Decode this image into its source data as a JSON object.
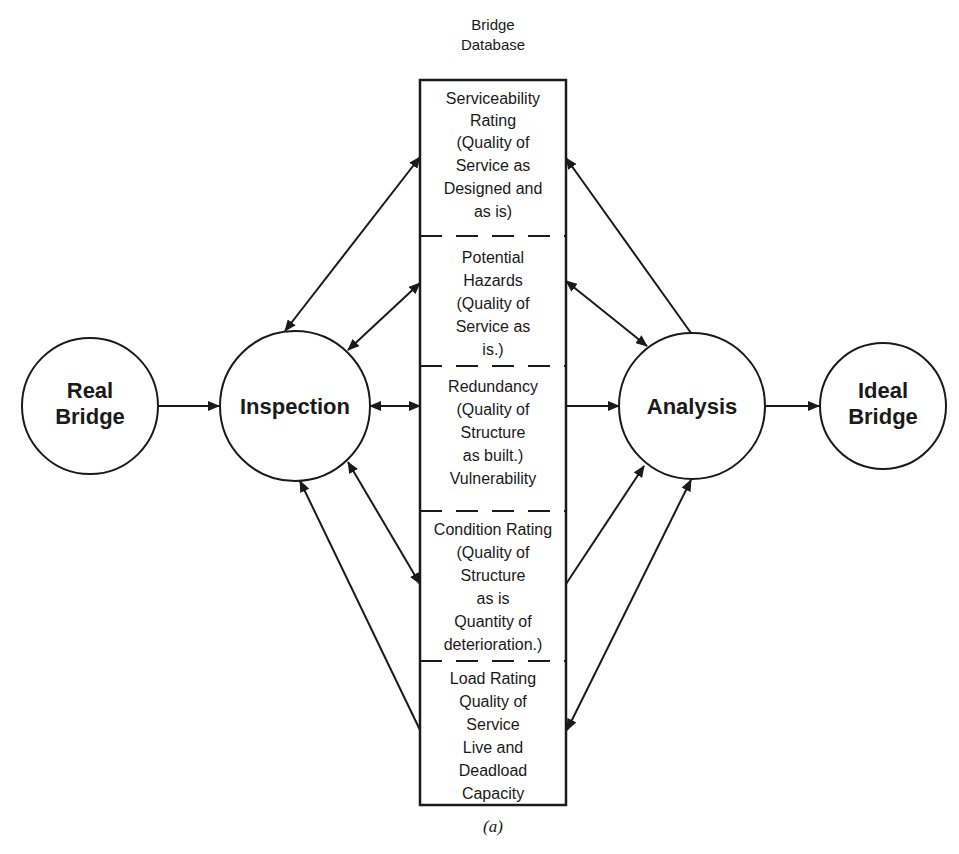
{
  "diagram": {
    "database_header": [
      "Bridge",
      "Database"
    ],
    "nodes": {
      "real_bridge": [
        "Real",
        "Bridge"
      ],
      "inspection": [
        "Inspection"
      ],
      "analysis": [
        "Analysis"
      ],
      "ideal_bridge": [
        "Ideal",
        "Bridge"
      ]
    },
    "sections": [
      {
        "id": "serviceability-rating",
        "lines": [
          "Serviceability",
          "Rating",
          "(Quality of",
          "Service as",
          "Designed and",
          "as is)"
        ]
      },
      {
        "id": "potential-hazards",
        "lines": [
          "Potential",
          "Hazards",
          "(Quality of",
          "Service as",
          "is.)"
        ]
      },
      {
        "id": "redundancy",
        "lines": [
          "Redundancy",
          "(Quality of",
          "Structure",
          "as built.)",
          "Vulnerability"
        ]
      },
      {
        "id": "condition-rating",
        "lines": [
          "Condition Rating",
          "(Quality of",
          "Structure",
          "as is",
          "Quantity of",
          "deterioration.)"
        ]
      },
      {
        "id": "load-rating",
        "lines": [
          "Load Rating",
          "Quality of",
          "Service",
          "Live and",
          "Deadload",
          "Capacity"
        ]
      }
    ],
    "edges": [
      {
        "from": "real_bridge",
        "to": "inspection",
        "direction": "forward"
      },
      {
        "from": "inspection",
        "to": "serviceability-rating",
        "direction": "both"
      },
      {
        "from": "inspection",
        "to": "potential-hazards",
        "direction": "both"
      },
      {
        "from": "inspection",
        "to": "redundancy",
        "direction": "both"
      },
      {
        "from": "inspection",
        "to": "condition-rating",
        "direction": "both"
      },
      {
        "from": "load-rating",
        "to": "inspection",
        "direction": "forward"
      },
      {
        "from": "analysis",
        "to": "serviceability-rating",
        "direction": "forward"
      },
      {
        "from": "potential-hazards",
        "to": "analysis",
        "direction": "both"
      },
      {
        "from": "redundancy",
        "to": "analysis",
        "direction": "forward"
      },
      {
        "from": "condition-rating",
        "to": "analysis",
        "direction": "forward"
      },
      {
        "from": "load-rating",
        "to": "analysis",
        "direction": "both"
      },
      {
        "from": "analysis",
        "to": "ideal_bridge",
        "direction": "forward"
      }
    ],
    "caption": "(a)"
  }
}
